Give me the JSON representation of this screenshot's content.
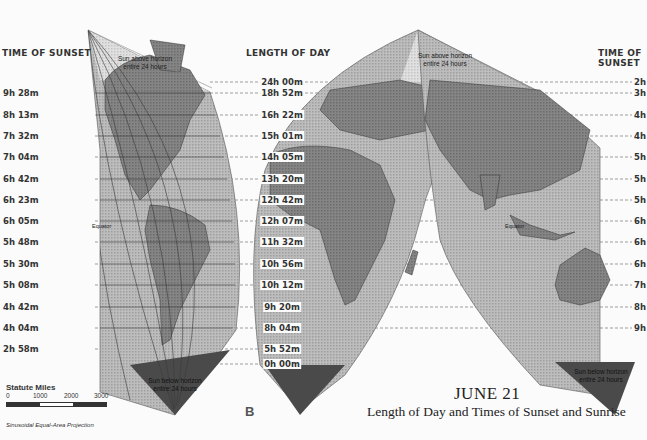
{
  "headers": {
    "left_sunset": "TIME OF SUNSET",
    "center_length": "LENGTH OF DAY",
    "right_sunset": "TIME OF SUNSET"
  },
  "rows": [
    {
      "y": 82,
      "sunset_left": "",
      "length": "24h 00m",
      "sunset_right": "2h"
    },
    {
      "y": 93,
      "sunset_left": "9h 28m",
      "length": "18h 52m",
      "sunset_right": "3h"
    },
    {
      "y": 115,
      "sunset_left": "8h 13m",
      "length": "16h 22m",
      "sunset_right": "4h"
    },
    {
      "y": 136,
      "sunset_left": "7h 32m",
      "length": "15h 01m",
      "sunset_right": "4h"
    },
    {
      "y": 157,
      "sunset_left": "7h 04m",
      "length": "14h 05m",
      "sunset_right": "5h"
    },
    {
      "y": 179,
      "sunset_left": "6h 42m",
      "length": "13h 20m",
      "sunset_right": "5h"
    },
    {
      "y": 200,
      "sunset_left": "6h 23m",
      "length": "12h 42m",
      "sunset_right": "5h"
    },
    {
      "y": 221,
      "sunset_left": "6h 05m",
      "length": "12h 07m",
      "sunset_right": "6h"
    },
    {
      "y": 242,
      "sunset_left": "5h 48m",
      "length": "11h 32m",
      "sunset_right": "6h"
    },
    {
      "y": 264,
      "sunset_left": "5h 30m",
      "length": "10h 56m",
      "sunset_right": "6h"
    },
    {
      "y": 285,
      "sunset_left": "5h 08m",
      "length": "10h 12m",
      "sunset_right": "7h"
    },
    {
      "y": 307,
      "sunset_left": "4h 42m",
      "length": "9h 20m",
      "sunset_right": "8h"
    },
    {
      "y": 328,
      "sunset_left": "4h 04m",
      "length": "8h 04m",
      "sunset_right": "9h"
    },
    {
      "y": 349,
      "sunset_left": "2h 58m",
      "length": "5h 52m",
      "sunset_right": ""
    },
    {
      "y": 364,
      "sunset_left": "",
      "length": "0h 00m",
      "sunset_right": ""
    }
  ],
  "annotations": {
    "sun_above_left": [
      "Sun above horizon",
      "entire 24 hours"
    ],
    "sun_above_right": [
      "Sun above horizon",
      "entire 24 hours"
    ],
    "sun_below_left": [
      "Sun below horizon",
      "entire 24 hours"
    ],
    "sun_below_right": [
      "Sun below horizon",
      "entire 24 hours"
    ],
    "equator_left": "Equator",
    "equator_right": "Equator",
    "lat_marks": [
      "80",
      "60",
      "40",
      "100",
      "120",
      "140",
      "160"
    ]
  },
  "scale": {
    "title": "Statute Miles",
    "ticks": [
      "0",
      "1000",
      "2000",
      "3000"
    ]
  },
  "projection": "Sinusoidal Equal-Area Projection",
  "plate_letter": "B",
  "title": {
    "date": "JUNE 21",
    "subtitle": "Length of Day and Times of Sunset and Sunrise"
  },
  "colors": {
    "background": "#fbfbfb",
    "ocean": "#b8b8b8",
    "ocean_light": "#d6d6d6",
    "land": "#7c7c7c",
    "polar_dark": "#4a4a4a",
    "grid": "#444444",
    "text": "#333333"
  }
}
